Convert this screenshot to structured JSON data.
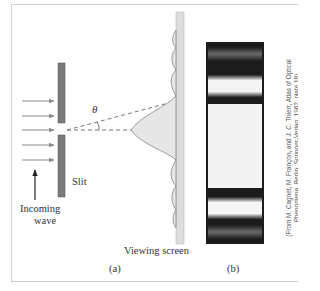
{
  "figure": {
    "panel_a": {
      "label": "(a)",
      "slit_label": "Slit",
      "incoming_wave_label_line1": "Incoming",
      "incoming_wave_label_line2": "wave",
      "screen_label": "Viewing screen",
      "angle_symbol": "θ",
      "incoming_arrow_count": 5
    },
    "panel_b": {
      "label": "(b)",
      "description": "Photograph of single-slit diffraction pattern: bright central band with dimmer side bands",
      "credit_line1": "(From M. Cagnet, M. Françon, and J. C. Thierr, Atlas of Optical",
      "credit_line2": "Phenomena, Berlin, Springer-Verlag, 1962, plate 18)"
    },
    "colors": {
      "slit_bar": "#7a7a7a",
      "arrows": "#8a8a8a",
      "screen": "#dcdcdc",
      "intensity_fill": "#e4e4e4",
      "photo_dark": "#1c1c1c",
      "frame": "#cfcfcf"
    }
  }
}
